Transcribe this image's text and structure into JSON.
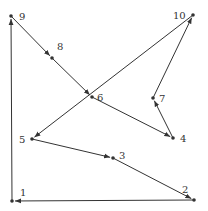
{
  "diagram": {
    "type": "directed-path",
    "points": [
      {
        "id": "1",
        "label": "1",
        "x": 12,
        "y": 201,
        "lx": 20,
        "ly": 196
      },
      {
        "id": "2",
        "label": "2",
        "x": 194,
        "y": 200,
        "lx": 182,
        "ly": 193
      },
      {
        "id": "3",
        "label": "3",
        "x": 113,
        "y": 158,
        "lx": 119,
        "ly": 159
      },
      {
        "id": "4",
        "label": "4",
        "x": 173,
        "y": 138,
        "lx": 180,
        "ly": 142
      },
      {
        "id": "5",
        "label": "5",
        "x": 32,
        "y": 139,
        "lx": 19,
        "ly": 143
      },
      {
        "id": "6",
        "label": "6",
        "x": 92,
        "y": 97,
        "lx": 97,
        "ly": 101
      },
      {
        "id": "7",
        "label": "7",
        "x": 153,
        "y": 98,
        "lx": 159,
        "ly": 102
      },
      {
        "id": "8",
        "label": "8",
        "x": 52,
        "y": 58,
        "lx": 57,
        "ly": 50
      },
      {
        "id": "9",
        "label": "9",
        "x": 11,
        "y": 16,
        "lx": 19,
        "ly": 20
      },
      {
        "id": "10",
        "label": "10",
        "x": 193,
        "y": 15,
        "lx": 173,
        "ly": 19
      }
    ],
    "edges": [
      [
        "1",
        "9"
      ],
      [
        "9",
        "8"
      ],
      [
        "8",
        "6"
      ],
      [
        "6",
        "4"
      ],
      [
        "4",
        "7"
      ],
      [
        "7",
        "10"
      ],
      [
        "10",
        "5"
      ],
      [
        "5",
        "3"
      ],
      [
        "3",
        "2"
      ],
      [
        "2",
        "1"
      ]
    ],
    "color": "#333333"
  }
}
